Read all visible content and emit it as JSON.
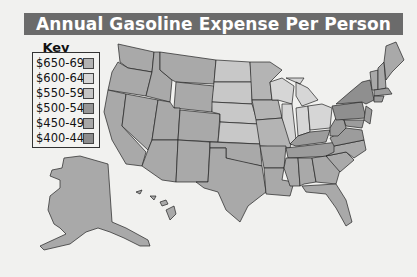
{
  "title": "Annual Gasoline Expense Per Person",
  "key": {
    "title": "Key",
    "items": [
      {
        "label": "$650-699",
        "color": "#b3b3b3"
      },
      {
        "label": "$600-649",
        "color": "#d6d6d6"
      },
      {
        "label": "$550-599",
        "color": "#c4c4c4"
      },
      {
        "label": "$500-549",
        "color": "#969696"
      },
      {
        "label": "$450-499",
        "color": "#a7a7a7"
      },
      {
        "label": "$400-449",
        "color": "#8c8c8c"
      }
    ]
  },
  "colors": {
    "background": "#f1f1ef",
    "title_bar": "#6b6b6b",
    "border": "#222222"
  }
}
